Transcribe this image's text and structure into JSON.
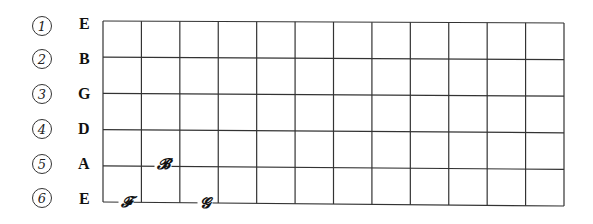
{
  "diagram": {
    "type": "guitar-fretboard",
    "fret_count": 12,
    "string_count": 6,
    "line_color": "#333333",
    "strings": [
      {
        "number": "1",
        "name": "E"
      },
      {
        "number": "2",
        "name": "B"
      },
      {
        "number": "3",
        "name": "G"
      },
      {
        "number": "4",
        "name": "D"
      },
      {
        "number": "5",
        "name": "A"
      },
      {
        "number": "6",
        "name": "E"
      }
    ],
    "notes": [
      {
        "label": "𝓕",
        "note": "F",
        "string": 6,
        "fret": 1
      },
      {
        "label": "𝓖",
        "note": "G",
        "string": 6,
        "fret": 3
      },
      {
        "label": "𝓑",
        "note": "B",
        "string": 5,
        "fret": 2
      }
    ]
  }
}
